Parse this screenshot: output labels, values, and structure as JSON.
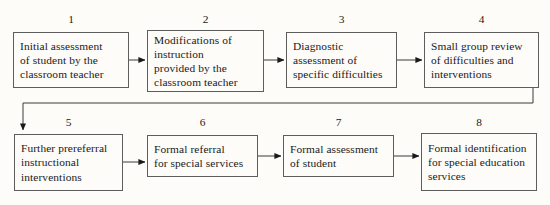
{
  "diagram": {
    "type": "flowchart",
    "orientation": "two-row serpentine, left-to-right",
    "colors": {
      "background": "#fdfcf8",
      "box_border": "#5d5d5d",
      "connector": "#3a3a3a",
      "text": "#1a1a1a"
    },
    "nodes": [
      {
        "number": "1",
        "label": "Initial assessment\nof student by the\nclassroom teacher"
      },
      {
        "number": "2",
        "label": "Modifications of\ninstruction\nprovided by the\nclassroom teacher"
      },
      {
        "number": "3",
        "label": "Diagnostic\nassessment of\nspecific difficulties"
      },
      {
        "number": "4",
        "label": "Small group review\nof difficulties and\ninterventions"
      },
      {
        "number": "5",
        "label": "Further prereferral\ninstructional\ninterventions"
      },
      {
        "number": "6",
        "label": "Formal referral\nfor special services"
      },
      {
        "number": "7",
        "label": "Formal assessment\nof student"
      },
      {
        "number": "8",
        "label": "Formal identification\nfor special education\nservices"
      }
    ],
    "connectors": [
      {
        "name": "arrow-1-to-2",
        "from": "1",
        "to": "2",
        "shape": "straight-horizontal"
      },
      {
        "name": "arrow-2-to-3",
        "from": "2",
        "to": "3",
        "shape": "straight-horizontal"
      },
      {
        "name": "arrow-3-to-4",
        "from": "3",
        "to": "4",
        "shape": "straight-horizontal"
      },
      {
        "name": "arrow-4-to-5",
        "from": "4",
        "to": "5",
        "shape": "elbow-down-left-down"
      },
      {
        "name": "arrow-5-to-6",
        "from": "5",
        "to": "6",
        "shape": "straight-horizontal"
      },
      {
        "name": "arrow-6-to-7",
        "from": "6",
        "to": "7",
        "shape": "straight-horizontal"
      },
      {
        "name": "arrow-7-to-8",
        "from": "7",
        "to": "8",
        "shape": "straight-horizontal"
      }
    ]
  }
}
